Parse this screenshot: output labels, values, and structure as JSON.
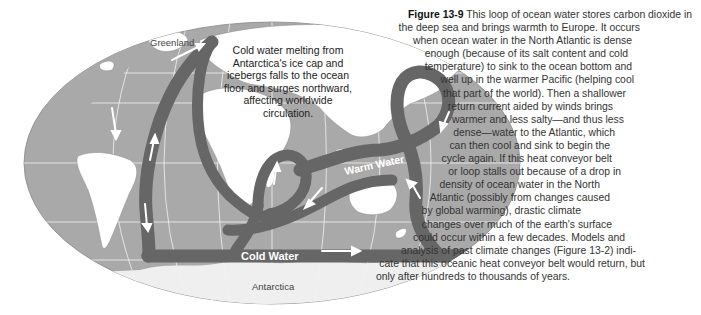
{
  "figure": {
    "number_label": "Figure 13-9",
    "caption_lines": [
      {
        "text": " This loop of ocean water stores carbon dioxide in",
        "right": 0
      },
      {
        "text": "the deep sea and brings warmth to Europe. It occurs",
        "right": 52
      },
      {
        "text": "when ocean water in the North Atlantic is dense",
        "right": 60
      },
      {
        "text": "enough (because of its salt content and cold",
        "right": 64
      },
      {
        "text": "temperature) to sink to the ocean bottom and",
        "right": 60
      },
      {
        "text": "well up in the warmer Pacific (helping cool",
        "right": 58
      },
      {
        "text": "that part of the world). Then a shallower",
        "right": 66
      },
      {
        "text": "return current aided by winds brings",
        "right": 79
      },
      {
        "text": "warmer and less salty—and thus less",
        "right": 68
      },
      {
        "text": "dense—water to the Atlantic, which",
        "right": 77
      },
      {
        "text": "can then cool and sink to begin the",
        "right": 82
      },
      {
        "text": "cycle again. If this heat conveyor belt",
        "right": 80
      },
      {
        "text": "or loop stalls out because of a drop in",
        "right": 71
      },
      {
        "text": "density of ocean water in the North",
        "right": 92
      },
      {
        "text": "Atlantic (possibly from changes caused",
        "right": 82
      },
      {
        "text": "by global warming), drastic climate",
        "right": 111
      },
      {
        "text": "changes over much of the earth's surface",
        "right": 80
      },
      {
        "text": "could occur within a few decades. Models and",
        "right": 67
      },
      {
        "text": "analysis of past climate changes (Figure 13-2) indi-",
        "right": 56
      },
      {
        "text": "cate that this oceanic heat conveyor belt would return, but",
        "right": 47
      },
      {
        "text": "only after hundreds to thousands of years.",
        "right": 122
      }
    ]
  },
  "map": {
    "labels": {
      "greenland": "Greenland",
      "antarctica": "Antarctica",
      "warm_water": "Warm Water",
      "cold_water": "Cold Water"
    },
    "callout": "Cold water melting from Antarctica's ice cap and icebergs falls to the ocean floor and surges northward, affecting worldwide circulation.",
    "colors": {
      "ocean": "#a9a9a9",
      "land": "#ffffff",
      "belt": "#666666",
      "arrow": "#ffffff",
      "grid": "#f2f2f2",
      "ice": "#eeeeee"
    }
  }
}
